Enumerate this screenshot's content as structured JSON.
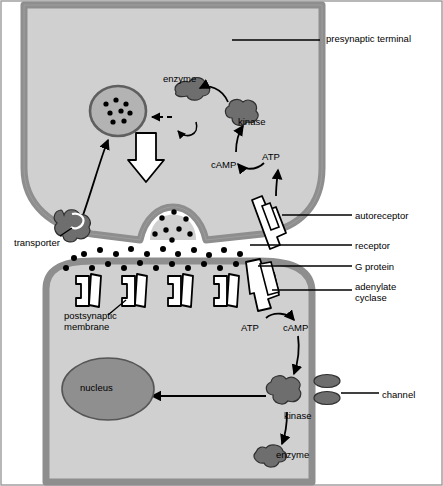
{
  "figure": {
    "colors": {
      "background": "#ffffff",
      "cell_fill": "#d0d0d0",
      "membrane_stroke": "#8a8a8a",
      "nucleus_fill": "#8f8f8f",
      "vesicle_fill": "#b0b0b0",
      "protein_fill": "#6e6e6e",
      "outline": "#000000",
      "border": "#808080"
    },
    "labels": [
      {
        "id": "presynaptic-terminal",
        "text": "presynaptic terminal",
        "x": 326,
        "y": 34,
        "align": "left"
      },
      {
        "id": "enzyme-top",
        "text": "enzyme",
        "x": 163,
        "y": 74,
        "align": "left"
      },
      {
        "id": "kinase-top",
        "text": "kinase",
        "x": 238,
        "y": 117,
        "align": "left"
      },
      {
        "id": "camp-top",
        "text": "cAMP",
        "x": 211,
        "y": 160,
        "align": "left"
      },
      {
        "id": "atp-top",
        "text": "ATP",
        "x": 262,
        "y": 152,
        "align": "left"
      },
      {
        "id": "autoreceptor",
        "text": "autoreceptor",
        "x": 355,
        "y": 211,
        "align": "left"
      },
      {
        "id": "transporter",
        "text": "transporter",
        "x": 14,
        "y": 238,
        "align": "left"
      },
      {
        "id": "receptor",
        "text": "receptor",
        "x": 355,
        "y": 241,
        "align": "left"
      },
      {
        "id": "g-protein",
        "text": "G protein",
        "x": 355,
        "y": 262,
        "align": "left"
      },
      {
        "id": "adenylate-cyclase",
        "text": "adenylate\ncyclase",
        "x": 355,
        "y": 282,
        "align": "left"
      },
      {
        "id": "postsynaptic-membrane",
        "text": "postsynaptic\nmembrane",
        "x": 64,
        "y": 311,
        "align": "left"
      },
      {
        "id": "atp-bottom",
        "text": "ATP",
        "x": 241,
        "y": 323,
        "align": "left"
      },
      {
        "id": "camp-bottom",
        "text": "cAMP",
        "x": 283,
        "y": 323,
        "align": "left"
      },
      {
        "id": "nucleus",
        "text": "nucleus",
        "x": 80,
        "y": 389,
        "align": "left"
      },
      {
        "id": "channel",
        "text": "channel",
        "x": 382,
        "y": 390,
        "align": "left"
      },
      {
        "id": "kinase-bottom",
        "text": "kinase",
        "x": 284,
        "y": 411,
        "align": "left"
      },
      {
        "id": "enzyme-bottom",
        "text": "enzyme",
        "x": 276,
        "y": 450,
        "align": "left"
      }
    ]
  }
}
